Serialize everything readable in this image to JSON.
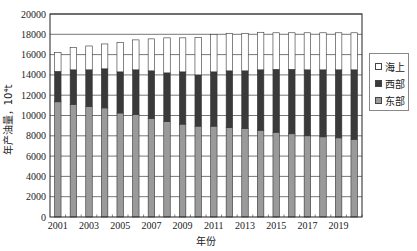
{
  "chart_data": {
    "type": "bar",
    "stacked": true,
    "title": "",
    "xlabel": "年份",
    "ylabel": "年产油量，10⁴t",
    "ylim": [
      0,
      20000
    ],
    "yticks": [
      0,
      2000,
      4000,
      6000,
      8000,
      10000,
      12000,
      14000,
      16000,
      18000,
      20000
    ],
    "xtick_labels": [
      "2001",
      "2003",
      "2005",
      "2007",
      "2009",
      "2011",
      "2013",
      "2015",
      "2017",
      "2019"
    ],
    "grid": true,
    "legend_position": "right",
    "categories": [
      "2001",
      "2002",
      "2003",
      "2004",
      "2005",
      "2006",
      "2007",
      "2008",
      "2009",
      "2010",
      "2011",
      "2012",
      "2013",
      "2014",
      "2015",
      "2016",
      "2017",
      "2018",
      "2019",
      "2020"
    ],
    "series": [
      {
        "name": "东部",
        "color": "#9a9a9a",
        "values": [
          11350,
          11100,
          10900,
          10750,
          10250,
          10100,
          9700,
          9400,
          9150,
          8950,
          8950,
          8800,
          8700,
          8550,
          8350,
          8200,
          8000,
          7900,
          7800,
          7650
        ]
      },
      {
        "name": "西部",
        "color": "#3a3a3a",
        "values": [
          3000,
          3400,
          3600,
          3850,
          4050,
          4400,
          4700,
          4800,
          5150,
          5050,
          5350,
          5600,
          5700,
          5950,
          6200,
          6350,
          6500,
          6600,
          6700,
          6850
        ]
      },
      {
        "name": "海上",
        "color": "#ffffff",
        "values": [
          1850,
          2200,
          2350,
          2450,
          2900,
          2950,
          3150,
          3450,
          3350,
          3700,
          3700,
          3700,
          3700,
          3700,
          3600,
          3600,
          3650,
          3650,
          3650,
          3650
        ]
      }
    ]
  },
  "legend": {
    "items": [
      {
        "label": "海上",
        "color": "#ffffff"
      },
      {
        "label": "西部",
        "color": "#3a3a3a"
      },
      {
        "label": "东部",
        "color": "#9a9a9a"
      }
    ]
  },
  "axes": {
    "xlabel": "年份",
    "ylabel": "年产油量，10⁴t"
  }
}
